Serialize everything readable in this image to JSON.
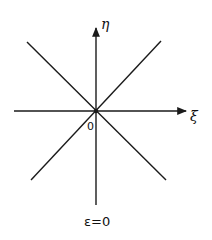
{
  "diagram": {
    "labels": {
      "vertical_axis": "η",
      "horizontal_axis": "ξ",
      "origin": "0",
      "caption": "ε=0"
    },
    "geometry": {
      "origin": [
        96,
        111
      ],
      "vertical_axis": {
        "x": 96,
        "y_top": 28,
        "y_bottom": 205
      },
      "horizontal_axis": {
        "y": 111,
        "x_left": 14,
        "x_right": 186
      },
      "diagonal_1": {
        "from": [
          27,
          42
        ],
        "to": [
          166,
          180
        ]
      },
      "diagonal_2": {
        "from": [
          161,
          41
        ],
        "to": [
          31,
          180
        ]
      }
    },
    "stroke_color": "#1a1a1a"
  }
}
